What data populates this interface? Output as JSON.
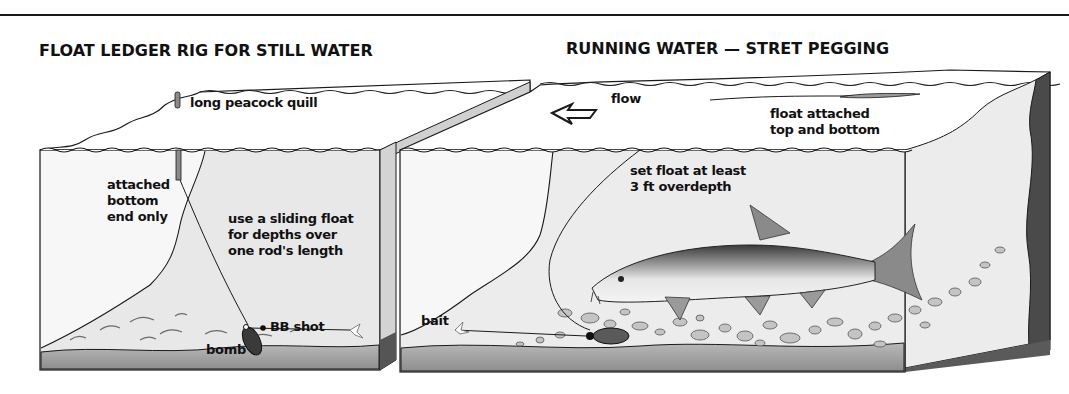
{
  "figure": {
    "panels": [
      {
        "id": "still-water",
        "title": "FLOAT LEDGER RIG FOR STILL WATER",
        "labels": {
          "float": "long peacock quill",
          "attach_line1": "attached",
          "attach_line2": "bottom",
          "attach_line3": "end only",
          "tip_line1": "use a sliding float",
          "tip_line2": "for depths over",
          "tip_line3": "one rod's length",
          "shot": "BB shot",
          "weight": "bomb"
        }
      },
      {
        "id": "running-water",
        "title": "RUNNING WATER — STRET PEGGING",
        "labels": {
          "flow": "flow",
          "float_line1": "float attached",
          "float_line2": "top and bottom",
          "depth_line1": "set float at least",
          "depth_line2": "3 ft overdepth",
          "bait": "bait"
        }
      }
    ],
    "colors": {
      "ink": "#1a1a1a",
      "water": "#e9e9e9",
      "water_deep": "#d8d8d8",
      "bed": "#9a9a9a",
      "bank": "#4a4a4a",
      "stones": "#bdbdbd",
      "fish_back": "#3a3a3a",
      "fish_belly": "#efefef"
    }
  }
}
